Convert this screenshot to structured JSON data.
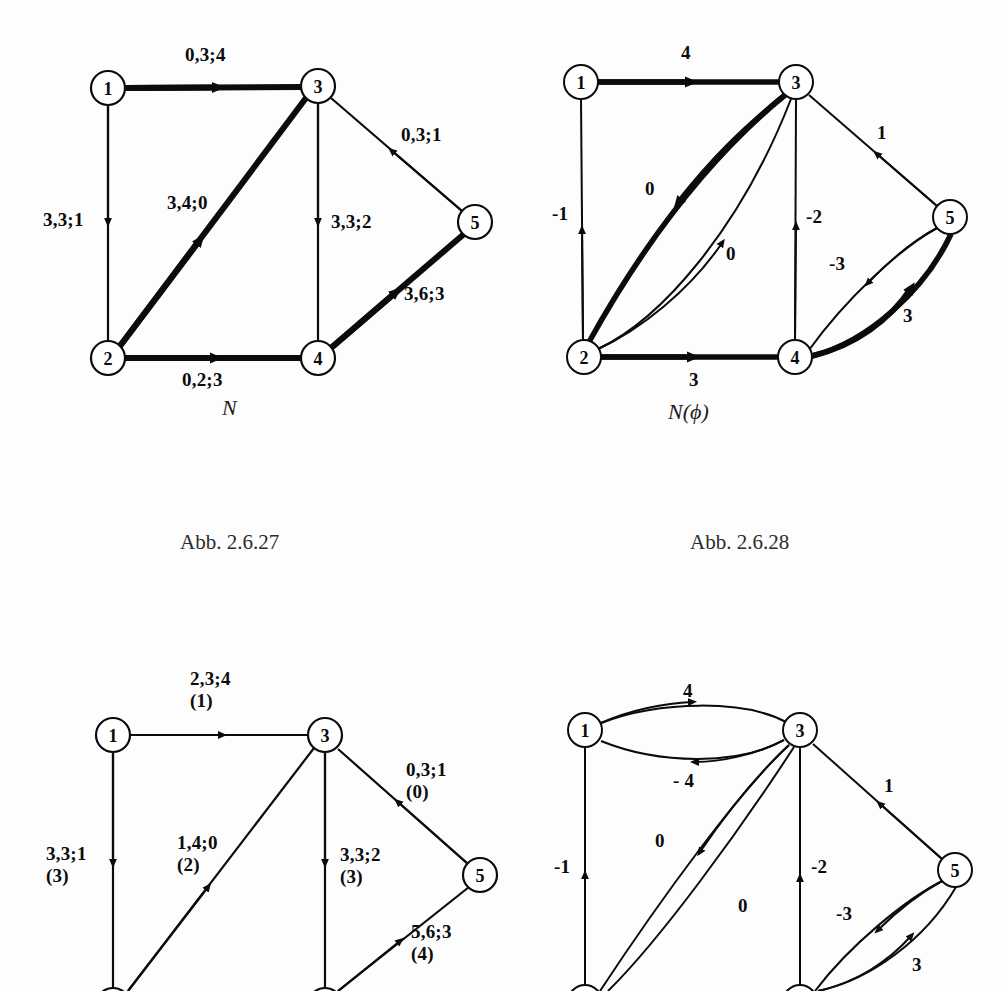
{
  "figures": [
    {
      "id": "fig-n",
      "name": "N",
      "caption": "Abb. 2.6.27",
      "nodes": [
        {
          "id": "1",
          "label": "1",
          "x": 108,
          "y": 88
        },
        {
          "id": "2",
          "label": "2",
          "x": 108,
          "y": 358
        },
        {
          "id": "3",
          "label": "3",
          "x": 318,
          "y": 86
        },
        {
          "id": "4",
          "label": "4",
          "x": 318,
          "y": 358
        },
        {
          "id": "5",
          "label": "5",
          "x": 475,
          "y": 222
        }
      ],
      "edges": [
        {
          "from": "1",
          "to": "3",
          "label": "0,3;4",
          "bold": true
        },
        {
          "from": "1",
          "to": "2",
          "label": "3,3;1",
          "bold": false
        },
        {
          "from": "2",
          "to": "3",
          "label": "3,4;0",
          "bold": true
        },
        {
          "from": "3",
          "to": "4",
          "label": "3,3;2",
          "bold": false
        },
        {
          "from": "2",
          "to": "4",
          "label": "0,2;3",
          "bold": true
        },
        {
          "from": "5",
          "to": "3",
          "label": "0,3;1",
          "bold": false
        },
        {
          "from": "4",
          "to": "5",
          "label": "3,6;3",
          "bold": true
        }
      ]
    },
    {
      "id": "fig-nphi",
      "name": "N(ϕ)",
      "caption": "Abb. 2.6.28",
      "nodes": [
        {
          "id": "1",
          "label": "1",
          "x": 581,
          "y": 82
        },
        {
          "id": "2",
          "label": "2",
          "x": 584,
          "y": 357
        },
        {
          "id": "3",
          "label": "3",
          "x": 796,
          "y": 82
        },
        {
          "id": "4",
          "label": "4",
          "x": 795,
          "y": 357
        },
        {
          "id": "5",
          "label": "5",
          "x": 950,
          "y": 217
        }
      ],
      "edges": [
        {
          "from": "1",
          "to": "3",
          "label": "4",
          "bold": true
        },
        {
          "from": "2",
          "to": "1",
          "label": "-1",
          "bold": false
        },
        {
          "from": "3",
          "to": "2",
          "label": "0",
          "bold": true
        },
        {
          "from": "2",
          "to": "3",
          "label": "0",
          "bold": false
        },
        {
          "from": "4",
          "to": "3",
          "label": "-2",
          "bold": false
        },
        {
          "from": "2",
          "to": "4",
          "label": "3",
          "bold": true
        },
        {
          "from": "5",
          "to": "3",
          "label": "1",
          "bold": false
        },
        {
          "from": "5",
          "to": "4",
          "label": "-3",
          "bold": false
        },
        {
          "from": "4",
          "to": "5",
          "label": "3",
          "bold": true
        }
      ]
    },
    {
      "id": "fig-n-lower",
      "name": "",
      "caption": "",
      "nodes": [
        {
          "id": "1",
          "label": "1",
          "x": 113,
          "y": 735
        },
        {
          "id": "3",
          "label": "3",
          "x": 325,
          "y": 735
        },
        {
          "id": "5",
          "label": "5",
          "x": 480,
          "y": 875
        }
      ],
      "edges": [
        {
          "from": "1",
          "to": "3",
          "label": "2,3;4",
          "label2": "(1)",
          "bold": false
        },
        {
          "from": "1",
          "to": "2",
          "label": "3,3;1",
          "label2": "(3)",
          "bold": false
        },
        {
          "from": "2",
          "to": "3",
          "label": "1,4;0",
          "label2": "(2)",
          "bold": false
        },
        {
          "from": "3",
          "to": "4",
          "label": "3,3;2",
          "label2": "(3)",
          "bold": false
        },
        {
          "from": "5",
          "to": "3",
          "label": "0,3;1",
          "label2": "(0)",
          "bold": false
        },
        {
          "from": "4",
          "to": "5",
          "label": "5,6;3",
          "label2": "(4)",
          "bold": false
        }
      ]
    },
    {
      "id": "fig-nphi-lower",
      "name": "",
      "caption": "",
      "nodes": [
        {
          "id": "1",
          "label": "1",
          "x": 585,
          "y": 730
        },
        {
          "id": "3",
          "label": "3",
          "x": 800,
          "y": 730
        },
        {
          "id": "5",
          "label": "5",
          "x": 955,
          "y": 870
        }
      ],
      "edges": [
        {
          "from": "1",
          "to": "3",
          "label": "4",
          "bold": false
        },
        {
          "from": "3",
          "to": "1",
          "label": "- 4",
          "bold": false
        },
        {
          "from": "2",
          "to": "1",
          "label": "-1",
          "bold": false
        },
        {
          "from": "3",
          "to": "2",
          "label": "0",
          "bold": false
        },
        {
          "from": "2",
          "to": "3",
          "label": "0",
          "bold": false
        },
        {
          "from": "4",
          "to": "3",
          "label": "-2",
          "bold": false
        },
        {
          "from": "5",
          "to": "3",
          "label": "1",
          "bold": false
        },
        {
          "from": "5",
          "to": "4",
          "label": "-3",
          "bold": false
        },
        {
          "from": "4",
          "to": "5",
          "label": "3",
          "bold": false
        }
      ]
    }
  ],
  "labels": {
    "tl": {
      "e13": "0,3;4",
      "e12": "3,3;1",
      "e23": "3,4;0",
      "e34": "3,3;2",
      "e24": "0,2;3",
      "e53": "0,3;1",
      "e45": "3,6;3",
      "name": "N",
      "caption": "Abb. 2.6.27"
    },
    "tr": {
      "e13": "4",
      "e21": "-1",
      "e32": "0",
      "e23": "0",
      "e43": "-2",
      "e24": "3",
      "e53": "1",
      "e54": "-3",
      "e45": "3",
      "name": "N(ϕ)",
      "caption": "Abb. 2.6.28"
    },
    "bl": {
      "e13a": "2,3;4",
      "e13b": "(1)",
      "e12a": "3,3;1",
      "e12b": "(3)",
      "e23a": "1,4;0",
      "e23b": "(2)",
      "e34a": "3,3;2",
      "e34b": "(3)",
      "e53a": "0,3;1",
      "e53b": "(0)",
      "e45a": "5,6;3",
      "e45b": "(4)"
    },
    "br": {
      "e13": "4",
      "e31": "- 4",
      "e21": "-1",
      "e32": "0",
      "e23": "0",
      "e43": "-2",
      "e53": "1",
      "e54": "-3",
      "e45": "3"
    }
  },
  "nodes_text": {
    "n1": "1",
    "n2": "2",
    "n3": "3",
    "n4": "4",
    "n5": "5"
  }
}
